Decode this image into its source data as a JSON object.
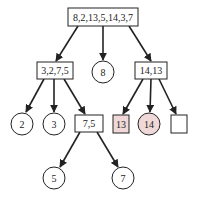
{
  "diagram": {
    "type": "tree",
    "colors": {
      "stroke": "#222222",
      "highlight_fill": "#f0d8d8",
      "fill": "#ffffff"
    },
    "nodes": [
      {
        "id": "root",
        "shape": "rect",
        "label": "8,2,13,5,14,3,7",
        "x": 68,
        "y": 8,
        "w": 70,
        "h": 18
      },
      {
        "id": "left",
        "shape": "rect",
        "label": "3,2,7,5",
        "x": 37,
        "y": 62,
        "w": 36,
        "h": 17
      },
      {
        "id": "mid",
        "shape": "circle",
        "label": "8",
        "cx": 103,
        "cy": 72,
        "r": 11
      },
      {
        "id": "right",
        "shape": "rect",
        "label": "14,13",
        "x": 135,
        "y": 62,
        "w": 32,
        "h": 17
      },
      {
        "id": "n2",
        "shape": "circle",
        "label": "2",
        "cx": 22,
        "cy": 124,
        "r": 11
      },
      {
        "id": "n3",
        "shape": "circle",
        "label": "3",
        "cx": 54,
        "cy": 124,
        "r": 11
      },
      {
        "id": "n75",
        "shape": "rect",
        "label": "7,5",
        "x": 75,
        "y": 115,
        "w": 28,
        "h": 17
      },
      {
        "id": "n13",
        "shape": "rect",
        "label": "13",
        "x": 113,
        "y": 115,
        "w": 16,
        "h": 18,
        "highlight": true
      },
      {
        "id": "n14",
        "shape": "circle",
        "label": "14",
        "cx": 149,
        "cy": 124,
        "r": 11,
        "highlight": true
      },
      {
        "id": "empty",
        "shape": "rect",
        "label": "",
        "x": 171,
        "y": 115,
        "w": 16,
        "h": 18
      },
      {
        "id": "n5",
        "shape": "circle",
        "label": "5",
        "cx": 54,
        "cy": 178,
        "r": 11
      },
      {
        "id": "n7",
        "shape": "circle",
        "label": "7",
        "cx": 123,
        "cy": 178,
        "r": 11
      }
    ],
    "edges": [
      {
        "from": "root",
        "to": "left",
        "x1": 78,
        "y1": 26,
        "x2": 56,
        "y2": 61
      },
      {
        "from": "root",
        "to": "mid",
        "x1": 103,
        "y1": 26,
        "x2": 103,
        "y2": 60
      },
      {
        "from": "root",
        "to": "right",
        "x1": 129,
        "y1": 26,
        "x2": 151,
        "y2": 61
      },
      {
        "from": "left",
        "to": "n2",
        "x1": 44,
        "y1": 79,
        "x2": 26,
        "y2": 112
      },
      {
        "from": "left",
        "to": "n3",
        "x1": 54,
        "y1": 79,
        "x2": 54,
        "y2": 112
      },
      {
        "from": "left",
        "to": "n75",
        "x1": 64,
        "y1": 79,
        "x2": 85,
        "y2": 114
      },
      {
        "from": "right",
        "to": "n13",
        "x1": 143,
        "y1": 79,
        "x2": 123,
        "y2": 114
      },
      {
        "from": "right",
        "to": "n14",
        "x1": 151,
        "y1": 79,
        "x2": 150,
        "y2": 112
      },
      {
        "from": "right",
        "to": "empty",
        "x1": 159,
        "y1": 79,
        "x2": 176,
        "y2": 114
      },
      {
        "from": "n75",
        "to": "n5",
        "x1": 80,
        "y1": 132,
        "x2": 60,
        "y2": 167
      },
      {
        "from": "n75",
        "to": "n7",
        "x1": 97,
        "y1": 132,
        "x2": 118,
        "y2": 167
      }
    ]
  }
}
